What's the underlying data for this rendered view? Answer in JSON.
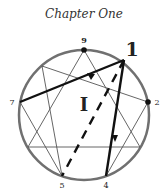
{
  "title": "Chapter One",
  "diagram": {
    "type": "enneagram",
    "highlighted_point_label": "1",
    "region_label": "I",
    "point_labels": {
      "p9": "9",
      "p1": "1",
      "p2": "2",
      "p4": "4",
      "p5": "5",
      "p7": "7"
    },
    "colors": {
      "circle": "#707070",
      "thin_lines": "#555555",
      "bold_lines": "#111111"
    }
  }
}
